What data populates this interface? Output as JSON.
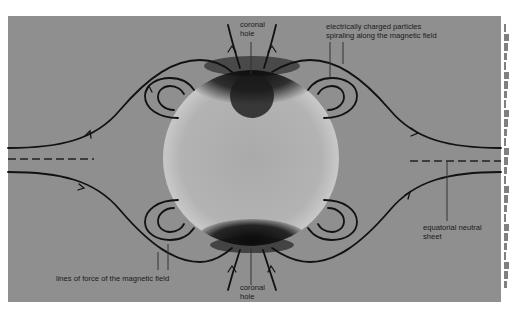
{
  "diagram": {
    "background_color": "#8f8f8f",
    "sun_color": "#b4b4b4",
    "line_color": "#111111",
    "labels": {
      "coronal_hole_top": [
        "coronal",
        "hole"
      ],
      "coronal_hole_bottom": [
        "coronal",
        "hole"
      ],
      "charged_particles": [
        "electrically charged particles",
        "spiraling along the magnetic field"
      ],
      "neutral_sheet": [
        "equatorial neutral",
        "sheet"
      ],
      "lines_of_force": "lines of force of the magnetic field"
    },
    "elements": [
      "sun-disk",
      "coronal-hole-north",
      "coronal-hole-south",
      "open-field-lines-north",
      "open-field-lines-south",
      "closed-loops-northwest",
      "closed-loops-northeast",
      "closed-loops-southwest",
      "closed-loops-southeast",
      "equatorial-neutral-sheet-left",
      "equatorial-neutral-sheet-right"
    ]
  },
  "edge_text_fragment_lines": 28
}
